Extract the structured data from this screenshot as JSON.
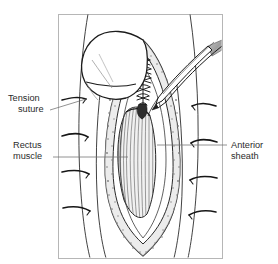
{
  "figure": {
    "type": "medical-line-illustration",
    "background_color": "#ffffff",
    "frame": {
      "color": "#b6b6b6",
      "x": 58,
      "y": 14,
      "width": 164,
      "height": 244
    },
    "ink_color": "#1d1d1d",
    "stipple_color": "#8a8a8a",
    "muscle_fiber_color": "#4a4a4a",
    "instrument_shade_color": "#a9a9a9"
  },
  "labels": [
    {
      "id": "tension-suture",
      "lines": [
        "Tension",
        "suture"
      ],
      "line1": "Tension",
      "line2": "suture",
      "text_x": 8,
      "text_y1": 101,
      "text_y2": 112,
      "leader": {
        "x1": 50,
        "y1": 110,
        "x2": 86,
        "y2": 99
      },
      "side": "left"
    },
    {
      "id": "rectus-muscle",
      "lines": [
        "Rectus",
        "muscle"
      ],
      "line1": "Rectus",
      "line2": "muscle",
      "text_x": 13,
      "text_y1": 148,
      "text_y2": 159,
      "leader": {
        "x1": 53,
        "y1": 157,
        "x2": 128,
        "y2": 157
      },
      "side": "left"
    },
    {
      "id": "anterior-sheath",
      "lines": [
        "Anterior",
        "sheath"
      ],
      "line1": "Anterior",
      "line2": "sheath",
      "text_x": 230,
      "text_y1": 148,
      "text_y2": 159,
      "leader": {
        "x1": 227,
        "y1": 145,
        "x2": 157,
        "y2": 145
      },
      "side": "right"
    }
  ],
  "anatomy": {
    "skin_flap": "retracted skin and fascia flap folded over upper left of wound",
    "incision": "vertical elliptical midline incision tapering to a V apex at bottom",
    "sheath_edges": "stippled granular anterior sheath bands flanking the wound",
    "rectus_muscle": "striated vertical muscle fibers in a lens-shaped bundle",
    "suture_line": "ladder of interrupted stitches closing the upper incision",
    "instrument": "forceps angled from upper right grasping the sheath edge",
    "tension_suture_count_left": 3,
    "tension_suture_count_right": 3
  }
}
